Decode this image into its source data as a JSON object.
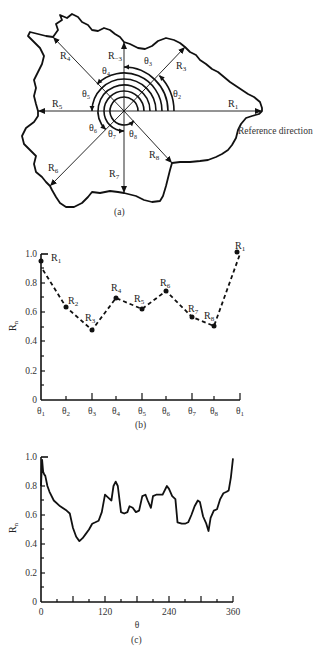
{
  "figure_a": {
    "caption": "(a)",
    "reference_label": "Reference direction",
    "radii": [
      {
        "name": "R",
        "sub": "1",
        "angle_deg": 0
      },
      {
        "name": "R",
        "sub": "3",
        "angle_deg": 45
      },
      {
        "name": "R",
        "sub": "−3",
        "angle_deg": 90
      },
      {
        "name": "R",
        "sub": "4",
        "angle_deg": 135
      },
      {
        "name": "R",
        "sub": "5",
        "angle_deg": 180
      },
      {
        "name": "R",
        "sub": "6",
        "angle_deg": 225
      },
      {
        "name": "R",
        "sub": "7",
        "angle_deg": 270
      },
      {
        "name": "R",
        "sub": "8",
        "angle_deg": 315
      }
    ],
    "angles": [
      "θ₂",
      "θ₃",
      "θ₄",
      "θ₅",
      "θ₆",
      "θ₇",
      "θ₈"
    ]
  },
  "chart_data": [
    {
      "type": "line",
      "caption": "(b)",
      "title": "",
      "xlabel": "",
      "ylabel": "R_n",
      "line_style": "dashed",
      "markers": true,
      "categories": [
        "θ1",
        "θ2",
        "θ3",
        "θ4",
        "θ5",
        "θ6",
        "θ7",
        "θ8",
        "θ1"
      ],
      "point_labels": [
        "R1",
        "R2",
        "R3",
        "R4",
        "R5",
        "R6",
        "R7",
        "R8",
        "R1"
      ],
      "values": [
        0.95,
        0.64,
        0.48,
        0.7,
        0.62,
        0.75,
        0.57,
        0.5,
        1.0
      ],
      "yticks": [
        0,
        0.2,
        0.4,
        0.6,
        0.8,
        1.0
      ],
      "ytick_labels": [
        "0",
        "0.2",
        "0.4",
        "0.6",
        "0.8",
        "1.0"
      ],
      "ylim": [
        0,
        1.0
      ],
      "grid": false
    },
    {
      "type": "line",
      "caption": "(c)",
      "title": "",
      "xlabel": "θ",
      "ylabel": "R_n",
      "line_style": "solid",
      "markers": false,
      "x": [
        0,
        2,
        4,
        6,
        8,
        12,
        16,
        24,
        36,
        48,
        54,
        60,
        66,
        72,
        78,
        84,
        90,
        96,
        102,
        108,
        114,
        120,
        126,
        132,
        136,
        140,
        144,
        150,
        156,
        162,
        166,
        172,
        178,
        184,
        190,
        196,
        200,
        206,
        210,
        216,
        222,
        228,
        236,
        240,
        246,
        252,
        256,
        264,
        270,
        276,
        282,
        288,
        294,
        298,
        304,
        310,
        314,
        318,
        324,
        330,
        336,
        342,
        348,
        352,
        356,
        360
      ],
      "y": [
        0.8,
        0.98,
        0.9,
        0.88,
        0.87,
        0.8,
        0.76,
        0.7,
        0.66,
        0.63,
        0.61,
        0.51,
        0.45,
        0.42,
        0.44,
        0.47,
        0.5,
        0.54,
        0.55,
        0.56,
        0.62,
        0.74,
        0.72,
        0.7,
        0.8,
        0.83,
        0.8,
        0.62,
        0.61,
        0.62,
        0.66,
        0.65,
        0.62,
        0.63,
        0.73,
        0.74,
        0.7,
        0.65,
        0.73,
        0.74,
        0.74,
        0.74,
        0.8,
        0.78,
        0.73,
        0.71,
        0.55,
        0.54,
        0.54,
        0.55,
        0.6,
        0.66,
        0.7,
        0.69,
        0.59,
        0.54,
        0.49,
        0.58,
        0.63,
        0.64,
        0.71,
        0.75,
        0.76,
        0.77,
        0.86,
        0.99
      ],
      "xticks": [
        0,
        120,
        240,
        360
      ],
      "xtick_labels": [
        "0",
        "120",
        "240",
        "360"
      ],
      "yticks": [
        0,
        0.2,
        0.4,
        0.6,
        0.8,
        1.0
      ],
      "ytick_labels": [
        "0",
        "0.2",
        "0.4",
        "0.6",
        "0.8",
        "1.0"
      ],
      "xlim": [
        0,
        360
      ],
      "ylim": [
        0,
        1.0
      ],
      "grid": false
    }
  ]
}
